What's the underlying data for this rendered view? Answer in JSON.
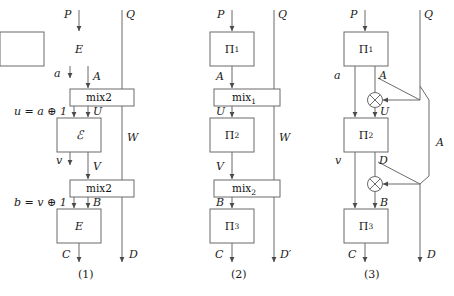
{
  "figure": {
    "background": "#ffffff",
    "line_color": "#555555",
    "text_color": "#1a1a1a"
  },
  "diagrams": [
    {
      "id": "diagram-1",
      "caption": "(1)",
      "inputs": {
        "left": "P",
        "right": "Q"
      },
      "outputs": {
        "left": "C",
        "right": "D"
      },
      "boxes": [
        {
          "name": "box-e-top",
          "label": "E",
          "style": "italic"
        },
        {
          "name": "box-mix2-upper",
          "label": "mix2",
          "style": "upright"
        },
        {
          "name": "box-script-e",
          "label": "ℰ",
          "style": "script"
        },
        {
          "name": "box-mix2-lower",
          "label": "mix2",
          "style": "upright"
        },
        {
          "name": "box-e-bottom",
          "label": "E",
          "style": "italic"
        }
      ],
      "wire_labels": [
        "A",
        "U",
        "V",
        "B",
        "W"
      ],
      "side_labels": [
        {
          "name": "label-a",
          "text": "a"
        },
        {
          "name": "label-u-eq",
          "text": "u = a ⊕ 1"
        },
        {
          "name": "label-v",
          "text": "v"
        },
        {
          "name": "label-b-eq",
          "text": "b = v ⊕ 1"
        }
      ]
    },
    {
      "id": "diagram-2",
      "caption": "(2)",
      "inputs": {
        "left": "P",
        "right": "Q"
      },
      "outputs": {
        "left": "C",
        "right": "D′"
      },
      "boxes": [
        {
          "name": "box-pi-1",
          "label": "Π",
          "sub": "1"
        },
        {
          "name": "box-mix-1",
          "label": "mix",
          "sub": "1"
        },
        {
          "name": "box-pi-2",
          "label": "Π",
          "sub": "2"
        },
        {
          "name": "box-mix-2",
          "label": "mix",
          "sub": "2"
        },
        {
          "name": "box-pi-3",
          "label": "Π",
          "sub": "3"
        }
      ],
      "wire_labels": [
        "A",
        "U",
        "V",
        "B",
        "W"
      ]
    },
    {
      "id": "diagram-3",
      "caption": "(3)",
      "inputs": {
        "left": "P",
        "right": "Q"
      },
      "outputs": {
        "left": "C",
        "right": "D"
      },
      "boxes": [
        {
          "name": "box-pi-1",
          "label": "Π",
          "sub": "1"
        },
        {
          "name": "box-pi-2",
          "label": "Π",
          "sub": "2"
        },
        {
          "name": "box-pi-3",
          "label": "Π",
          "sub": "3"
        }
      ],
      "xor_gates": [
        {
          "name": "xor-gate-upper",
          "symbol": "⊕"
        },
        {
          "name": "xor-gate-lower",
          "symbol": "⊕"
        }
      ],
      "wire_labels": [
        "a",
        "A",
        "U",
        "v",
        "D",
        "B",
        "A"
      ]
    }
  ]
}
